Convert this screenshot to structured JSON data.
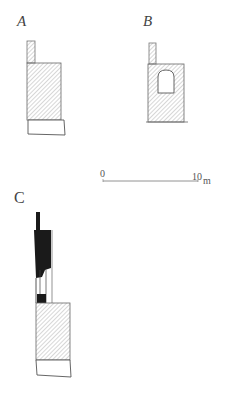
{
  "figures": [
    {
      "label": "A",
      "description": "Elevation with chimney, hatched wall, plinth"
    },
    {
      "label": "B",
      "description": "Elevation with chimney and arched opening"
    },
    {
      "label": "C",
      "description": "Section with blackened upper part, hatched wall, plinth"
    }
  ],
  "scale_bar": {
    "start": "0",
    "end": "10",
    "unit": "m"
  },
  "colors": {
    "line": "#555555",
    "hatch": "#9a9a9a",
    "solid": "#1a1a1a"
  }
}
